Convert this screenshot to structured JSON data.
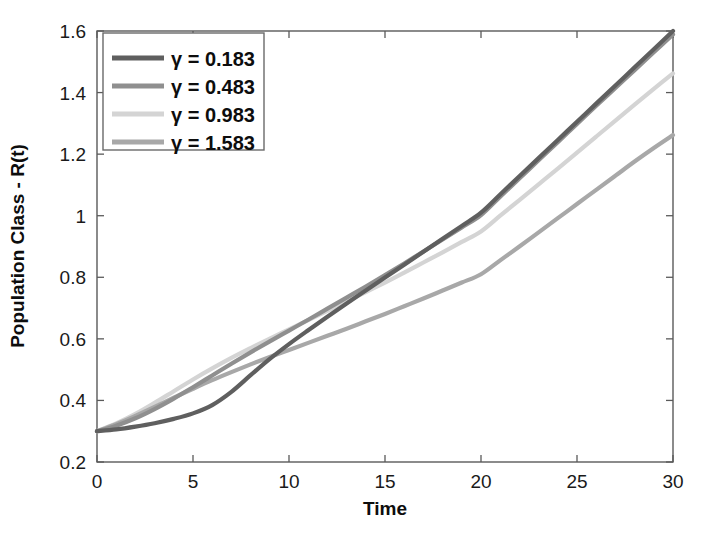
{
  "chart_data": {
    "type": "line",
    "title": "",
    "xlabel": "Time",
    "ylabel": "Population Class - R(t)",
    "xlim": [
      0,
      30
    ],
    "ylim": [
      0.2,
      1.6
    ],
    "xticks": [
      0,
      5,
      10,
      15,
      20,
      25,
      30
    ],
    "xtick_labels": [
      "0",
      "5",
      "10",
      "15",
      "20",
      "25",
      "30"
    ],
    "yticks": [
      0.2,
      0.4,
      0.6,
      0.8,
      1.0,
      1.2,
      1.4,
      1.6
    ],
    "ytick_labels": [
      "0.2",
      "0.4",
      "0.6",
      "0.8",
      "1",
      "1.2",
      "1.4",
      "1.6"
    ],
    "grid": false,
    "legend_position": "upper left",
    "x": [
      0,
      1,
      2,
      3,
      4,
      5,
      6,
      7,
      8,
      9,
      10,
      11,
      12,
      13,
      14,
      15,
      16,
      17,
      18,
      19,
      20,
      21,
      22,
      23,
      24,
      25,
      26,
      27,
      28,
      29,
      30
    ],
    "series": [
      {
        "name": "γ = 0.183",
        "gamma": 0.183,
        "color": "#5f5f5f",
        "values": [
          0.3,
          0.306,
          0.315,
          0.326,
          0.34,
          0.358,
          0.385,
          0.428,
          0.482,
          0.535,
          0.583,
          0.628,
          0.672,
          0.715,
          0.757,
          0.799,
          0.841,
          0.883,
          0.925,
          0.967,
          1.01,
          1.069,
          1.128,
          1.187,
          1.246,
          1.305,
          1.364,
          1.423,
          1.482,
          1.541,
          1.6
        ]
      },
      {
        "name": "γ = 0.483",
        "gamma": 0.483,
        "color": "#8f8f8f",
        "values": [
          0.3,
          0.318,
          0.342,
          0.372,
          0.406,
          0.443,
          0.481,
          0.519,
          0.556,
          0.592,
          0.627,
          0.662,
          0.698,
          0.734,
          0.77,
          0.807,
          0.845,
          0.884,
          0.923,
          0.962,
          1.002,
          1.062,
          1.121,
          1.18,
          1.239,
          1.298,
          1.357,
          1.415,
          1.473,
          1.531,
          1.589
        ]
      },
      {
        "name": "γ = 0.983",
        "gamma": 0.983,
        "color": "#d4d4d4",
        "values": [
          0.3,
          0.325,
          0.356,
          0.392,
          0.43,
          0.468,
          0.504,
          0.538,
          0.57,
          0.601,
          0.631,
          0.661,
          0.691,
          0.721,
          0.752,
          0.783,
          0.815,
          0.848,
          0.881,
          0.915,
          0.949,
          1.0,
          1.051,
          1.102,
          1.153,
          1.205,
          1.257,
          1.309,
          1.361,
          1.412,
          1.462
        ]
      },
      {
        "name": "γ = 1.583",
        "gamma": 1.583,
        "color": "#a8a8a8",
        "values": [
          0.3,
          0.323,
          0.35,
          0.379,
          0.409,
          0.438,
          0.466,
          0.492,
          0.517,
          0.541,
          0.564,
          0.587,
          0.61,
          0.633,
          0.657,
          0.681,
          0.706,
          0.731,
          0.757,
          0.783,
          0.81,
          0.855,
          0.9,
          0.946,
          0.992,
          1.038,
          1.084,
          1.13,
          1.176,
          1.22,
          1.262
        ]
      }
    ]
  },
  "legend": {
    "entries": [
      {
        "label": "γ = 0.183",
        "color": "#5f5f5f"
      },
      {
        "label": "γ = 0.483",
        "color": "#8f8f8f"
      },
      {
        "label": "γ = 0.983",
        "color": "#d4d4d4"
      },
      {
        "label": "γ = 1.583",
        "color": "#a8a8a8"
      }
    ]
  },
  "axes": {
    "x_title": "Time",
    "y_title": "Population Class - R(t)"
  }
}
